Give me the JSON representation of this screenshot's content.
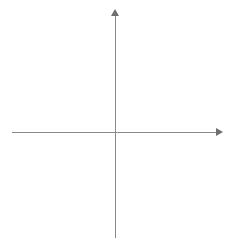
{
  "figure": {
    "kind": "cartesian-coordinate-plane",
    "axis_labels": {
      "x": "x",
      "y": "y"
    },
    "origin_label": "0",
    "x_tick_labels": [
      "−6",
      "−5",
      "−4",
      "−3",
      "−2",
      "−1",
      "1",
      "2",
      "3",
      "4",
      "5",
      "6"
    ],
    "y_tick_labels": [
      "6",
      "5",
      "4",
      "3",
      "2",
      "1",
      "−1",
      "−2",
      "−3",
      "−4",
      "−5",
      "−6"
    ],
    "colors": {
      "background": "#ffffff",
      "grid": "#c9c9c9",
      "axis": "#8a8a8a",
      "arrow": "#6f6f6f",
      "label": "#2b2b2b"
    }
  },
  "chart_data": {
    "type": "scatter",
    "title": "",
    "subtitle": "",
    "xlabel": "x",
    "ylabel": "y",
    "xlim": [
      -6,
      6
    ],
    "ylim": [
      -6,
      6
    ],
    "xticks": [
      -6,
      -5,
      -4,
      -3,
      -2,
      -1,
      0,
      1,
      2,
      3,
      4,
      5,
      6
    ],
    "yticks": [
      -6,
      -5,
      -4,
      -3,
      -2,
      -1,
      0,
      1,
      2,
      3,
      4,
      5,
      6
    ],
    "xtick_labels": [
      "−6",
      "−5",
      "−4",
      "−3",
      "−2",
      "−1",
      "0",
      "1",
      "2",
      "3",
      "4",
      "5",
      "6"
    ],
    "ytick_labels": [
      "−6",
      "−5",
      "−4",
      "−3",
      "−2",
      "−1",
      "0",
      "1",
      "2",
      "3",
      "4",
      "5",
      "6"
    ],
    "grid": true,
    "grid_style": "dotted",
    "legend": false,
    "legend_position": "none",
    "series": [],
    "annotations": []
  }
}
